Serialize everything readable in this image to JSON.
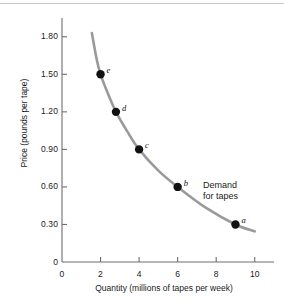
{
  "chart_data": {
    "type": "line",
    "title": "",
    "subtitle": "",
    "xlabel": "Quantity (millions of tapes per week)",
    "ylabel": "Price (pounds per tape)",
    "xlim": [
      0,
      11
    ],
    "ylim": [
      0,
      1.95
    ],
    "grid": false,
    "legend_position": "inline-annotation",
    "xticks": [
      0,
      2,
      4,
      6,
      8,
      10
    ],
    "xtick_labels": [
      "0",
      "2",
      "4",
      "6",
      "8",
      "10"
    ],
    "yticks": [
      0,
      0.3,
      0.6,
      0.9,
      1.2,
      1.5,
      1.8
    ],
    "ytick_labels": [
      "0",
      "0.30",
      "0.60",
      "0.90",
      "1.20",
      "1.50",
      "1.80"
    ],
    "series": [
      {
        "name": "Demand for tapes",
        "color": "#9a9a9a",
        "x": [
          1.55,
          1.8,
          2.0,
          2.4,
          2.8,
          3.4,
          4.0,
          5.0,
          6.0,
          7.5,
          9.0,
          10.0
        ],
        "y": [
          1.83,
          1.62,
          1.5,
          1.34,
          1.2,
          1.04,
          0.9,
          0.73,
          0.6,
          0.43,
          0.3,
          0.245
        ]
      }
    ],
    "points": [
      {
        "label": "a",
        "x": 9.0,
        "y": 0.3,
        "label_dx": 6,
        "label_dy": -9
      },
      {
        "label": "b",
        "x": 6.0,
        "y": 0.6,
        "label_dx": 6,
        "label_dy": -9
      },
      {
        "label": "c",
        "x": 4.0,
        "y": 0.9,
        "label_dx": 6,
        "label_dy": -9
      },
      {
        "label": "d",
        "x": 2.8,
        "y": 1.2,
        "label_dx": 6,
        "label_dy": -9
      },
      {
        "label": "e",
        "x": 2.0,
        "y": 1.5,
        "label_dx": 6,
        "label_dy": -9
      }
    ],
    "annotations": [
      {
        "name": "demand-curve-label",
        "line1": "Demand",
        "line2": "for tapes"
      }
    ],
    "colors": {
      "curve": "#9a9a9a",
      "points": "#111111",
      "axis": "#6e6e6e",
      "text": "#1a1a1a"
    }
  }
}
